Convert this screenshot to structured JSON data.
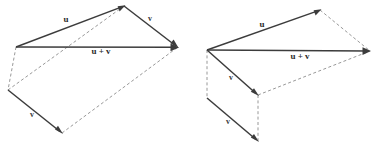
{
  "figure": {
    "background_color": "#ffffff",
    "solid_stroke_color": "#3c3c3c",
    "dashed_stroke_color": "#8c8c8c",
    "label_color": "#2a2a2a",
    "panels": [
      {
        "id": "left-panel",
        "name": "parallelogram-vector-addition",
        "labels": [
          {
            "id": "u",
            "text": "u",
            "x": 66,
            "y": 20
          },
          {
            "id": "v-upper",
            "text": "v",
            "x": 150,
            "y": 19
          },
          {
            "id": "u-plus-v",
            "text": "u + v",
            "x": 101,
            "y": 52
          },
          {
            "id": "v-lower",
            "text": "v",
            "x": 32,
            "y": 115
          }
        ],
        "vectors": [
          {
            "id": "u",
            "from": [
              16,
              47
            ],
            "to": [
              124,
              6
            ],
            "style": "solid",
            "arrow": true
          },
          {
            "id": "v-upper",
            "from": [
              124,
              6
            ],
            "to": [
              178,
              47
            ],
            "style": "solid",
            "arrow": true
          },
          {
            "id": "u-plus-v",
            "from": [
              16,
              47
            ],
            "to": [
              178,
              47
            ],
            "style": "solid",
            "arrow": true
          },
          {
            "id": "v-lower",
            "from": [
              8,
              90
            ],
            "to": [
              62,
              133
            ],
            "style": "solid",
            "arrow": true
          }
        ],
        "dashed_edges": [
          {
            "id": "diag-origin-to-tip",
            "from": [
              8,
              90
            ],
            "to": [
              124,
              6
            ]
          },
          {
            "id": "left-side",
            "from": [
              16,
              47
            ],
            "to": [
              8,
              90
            ]
          },
          {
            "id": "bottom-edge",
            "from": [
              62,
              133
            ],
            "to": [
              178,
              47
            ]
          }
        ]
      },
      {
        "id": "right-panel",
        "name": "box-vector-addition",
        "labels": [
          {
            "id": "u",
            "text": "u",
            "x": 262,
            "y": 25
          },
          {
            "id": "u-plus-v",
            "text": "u + v",
            "x": 300,
            "y": 57
          },
          {
            "id": "v-upper",
            "text": "v",
            "x": 231,
            "y": 78
          },
          {
            "id": "v-lower",
            "text": "v",
            "x": 228,
            "y": 122
          }
        ],
        "vectors": [
          {
            "id": "u",
            "from": [
              207,
              50
            ],
            "to": [
              320,
              10
            ],
            "style": "solid",
            "arrow": true
          },
          {
            "id": "u-plus-v",
            "from": [
              207,
              50
            ],
            "to": [
              370,
              51
            ],
            "style": "solid",
            "arrow": true
          },
          {
            "id": "v-upper",
            "from": [
              207,
              50
            ],
            "to": [
              258,
              95
            ],
            "style": "solid",
            "arrow": true
          },
          {
            "id": "v-lower",
            "from": [
              207,
              98
            ],
            "to": [
              258,
              141
            ],
            "style": "solid",
            "arrow": true
          }
        ],
        "dashed_edges": [
          {
            "id": "top-right-edge",
            "from": [
              320,
              10
            ],
            "to": [
              370,
              51
            ]
          },
          {
            "id": "mid-diagonal",
            "from": [
              258,
              95
            ],
            "to": [
              370,
              51
            ]
          },
          {
            "id": "left-vertical",
            "from": [
              207,
              50
            ],
            "to": [
              207,
              98
            ]
          },
          {
            "id": "right-vertical",
            "from": [
              258,
              95
            ],
            "to": [
              258,
              141
            ]
          }
        ]
      }
    ]
  }
}
